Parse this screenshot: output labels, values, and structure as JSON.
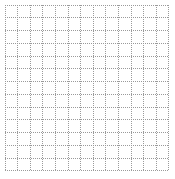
{
  "canvas": {
    "width": 175,
    "height": 179,
    "background_color": "#ffffff"
  },
  "grid": {
    "title": "",
    "description": "graph-paper grid",
    "area": {
      "left": 5,
      "top": 5,
      "width": 164,
      "height": 166
    },
    "columns": 13,
    "rows": 13,
    "cell_width": 12.6,
    "cell_height": 12.8,
    "line_color": "#9a9a9a",
    "line_width": 1,
    "line_style": "dotted",
    "dash_pattern": "1 1",
    "x_positions": [
      0,
      12.6,
      25.2,
      37.8,
      50.5,
      63.1,
      75.7,
      88.3,
      100.9,
      113.5,
      126.2,
      138.8,
      151.4,
      164
    ],
    "y_positions": [
      0,
      12.8,
      25.5,
      38.3,
      51.1,
      63.8,
      76.6,
      89.4,
      102.2,
      114.9,
      127.7,
      140.5,
      153.2,
      166
    ]
  }
}
